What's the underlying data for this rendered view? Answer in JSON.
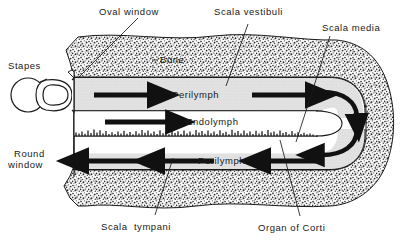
{
  "figure": {
    "type": "anatomical-diagram",
    "background_color": "#ffffff",
    "ink_color": "#1a1a1a",
    "bone_fill": "#8d8d8d",
    "perilymph_fill": "#dcdcdc",
    "endolymph_fill": "#ffffff"
  },
  "labels": {
    "oval_window": "Oval window",
    "scala_vestibuli": "Scala vestibuli",
    "scala_media": "Scala media",
    "stapes": "Stapes",
    "bone": "Bone",
    "perilymph_upper": "Perilymph",
    "endolymph": "Endolymph",
    "round_window_line1": "Round",
    "round_window_line2": "window",
    "perilymph_lower": "Perilymph",
    "scala_tympani": "Scala  tympani",
    "organ_of_corti": "Organ of Corti"
  },
  "structures": {
    "stapes_name": "stapes",
    "oval_window_name": "oval-window",
    "round_window_name": "round-window",
    "basilar_membrane_name": "basilar-membrane",
    "helicotrema_name": "helicotrema"
  },
  "flow": {
    "upper_channel_direction": "right",
    "upper_channel_arrow_count": 2,
    "endolymph_arrow_count": 1,
    "endolymph_direction": "right",
    "lower_channel_direction": "left",
    "lower_channel_arrow_count": 3,
    "apex_curved_arrow_count": 2,
    "apex_description": "Perilymph turns around the end of the scala media at the helicotrema"
  }
}
